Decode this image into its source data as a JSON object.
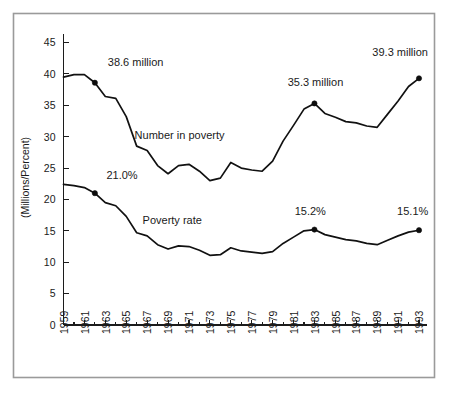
{
  "chart_data": {
    "type": "line",
    "title": "",
    "xlabel": "",
    "ylabel": "(Millions/Percent)",
    "ylim": [
      0,
      47
    ],
    "xlim": [
      1959,
      1993
    ],
    "grid": false,
    "legend_position": "inline-labels",
    "y_ticks": [
      0,
      5,
      10,
      15,
      20,
      25,
      30,
      35,
      40,
      45
    ],
    "x_ticks": [
      1959,
      1961,
      1963,
      1965,
      1967,
      1969,
      1971,
      1973,
      1975,
      1977,
      1979,
      1981,
      1983,
      1985,
      1987,
      1989,
      1991,
      1993
    ],
    "x_minor_ticks": [
      1960,
      1962,
      1964,
      1966,
      1968,
      1970,
      1972,
      1974,
      1976,
      1978,
      1980,
      1982,
      1984,
      1986,
      1988,
      1990,
      1992
    ],
    "x": [
      1959,
      1960,
      1961,
      1962,
      1963,
      1964,
      1965,
      1966,
      1967,
      1968,
      1969,
      1970,
      1971,
      1972,
      1973,
      1974,
      1975,
      1976,
      1977,
      1978,
      1979,
      1980,
      1981,
      1982,
      1983,
      1984,
      1985,
      1986,
      1987,
      1988,
      1989,
      1990,
      1991,
      1992,
      1993
    ],
    "series": [
      {
        "name": "Number in poverty",
        "units": "millions",
        "label_text": "Number in poverty",
        "label_x": 1970.1,
        "label_y": 29.6,
        "color": "#111111",
        "values": [
          39.5,
          39.9,
          39.9,
          38.6,
          36.4,
          36.1,
          33.2,
          28.5,
          27.8,
          25.4,
          24.1,
          25.4,
          25.6,
          24.5,
          23.0,
          23.4,
          25.9,
          25.0,
          24.7,
          24.5,
          26.1,
          29.3,
          31.8,
          34.4,
          35.3,
          33.7,
          33.1,
          32.4,
          32.2,
          31.7,
          31.5,
          33.6,
          35.7,
          38.0,
          39.3
        ]
      },
      {
        "name": "Poverty rate",
        "units": "percent",
        "label_text": "Poverty rate",
        "label_x": 1969.4,
        "label_y": 16.1,
        "color": "#111111",
        "values": [
          22.4,
          22.2,
          21.9,
          21.0,
          19.5,
          19.0,
          17.3,
          14.7,
          14.2,
          12.8,
          12.1,
          12.6,
          12.5,
          11.9,
          11.1,
          11.2,
          12.3,
          11.8,
          11.6,
          11.4,
          11.7,
          13.0,
          14.0,
          15.0,
          15.2,
          14.4,
          14.0,
          13.6,
          13.4,
          13.0,
          12.8,
          13.5,
          14.2,
          14.8,
          15.1
        ]
      }
    ],
    "annotations": [
      {
        "text": "38.6 million",
        "point_x": 1962,
        "point_y": 38.6,
        "label_x": 1965.9,
        "label_y": 41.2,
        "marker": true
      },
      {
        "text": "21.0%",
        "point_x": 1962,
        "point_y": 21.0,
        "label_x": 1964.6,
        "label_y": 23.3,
        "marker": true
      },
      {
        "text": "35.3 million",
        "point_x": 1983,
        "point_y": 35.3,
        "label_x": 1983.1,
        "label_y": 38.0,
        "marker": true
      },
      {
        "text": "15.2%",
        "point_x": 1983,
        "point_y": 15.2,
        "label_x": 1982.6,
        "label_y": 17.6,
        "marker": true
      },
      {
        "text": "39.3 million",
        "point_x": 1993,
        "point_y": 39.3,
        "label_x": 1991.2,
        "label_y": 42.9,
        "marker": true
      },
      {
        "text": "15.1%",
        "point_x": 1993,
        "point_y": 15.1,
        "label_x": 1992.4,
        "label_y": 17.5,
        "marker": true
      }
    ]
  }
}
